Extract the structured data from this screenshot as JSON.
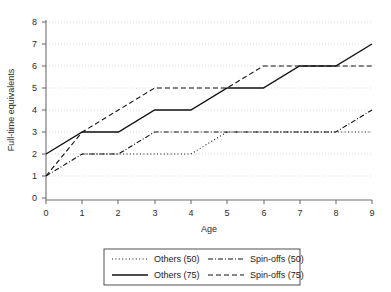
{
  "chart_data": {
    "type": "line",
    "title": "",
    "xlabel": "Age",
    "ylabel": "Full-time equivalents",
    "xlim": [
      0,
      9
    ],
    "ylim": [
      0,
      8
    ],
    "xticks": [
      0,
      1,
      2,
      3,
      4,
      5,
      6,
      7,
      8,
      9
    ],
    "yticks": [
      0,
      1,
      2,
      3,
      4,
      5,
      6,
      7,
      8
    ],
    "xtick_labels": [
      "0",
      "1",
      "2",
      "3",
      "4",
      "5",
      "6",
      "7",
      "8",
      "9"
    ],
    "ytick_labels": [
      "0",
      "1",
      "2",
      "3",
      "4",
      "5",
      "6",
      "7",
      "8"
    ],
    "grid": "horizontal-dotted",
    "legend_position": "below-axes",
    "x": [
      0,
      1,
      2,
      3,
      4,
      5,
      6,
      7,
      8,
      9
    ],
    "series": [
      {
        "name": "Others (50)",
        "style": "dotted",
        "color": "#111111",
        "x": [
          1,
          2,
          3,
          4,
          5,
          6,
          7,
          8,
          9
        ],
        "values": [
          2,
          2,
          2,
          2,
          3,
          3,
          3,
          3,
          3
        ]
      },
      {
        "name": "Others (75)",
        "style": "solid",
        "color": "#111111",
        "x": [
          0,
          1,
          2,
          3,
          4,
          5,
          6,
          7,
          8,
          9
        ],
        "values": [
          2,
          3,
          3,
          4,
          4,
          5,
          5,
          6,
          6,
          7
        ]
      },
      {
        "name": "Spin-offs (50)",
        "style": "dash-dot",
        "color": "#111111",
        "x": [
          0,
          1,
          2,
          3,
          4,
          5,
          6,
          7,
          8,
          9
        ],
        "values": [
          1,
          2,
          2,
          3,
          3,
          3,
          3,
          3,
          3,
          4
        ]
      },
      {
        "name": "Spin-offs (75)",
        "style": "dashed",
        "color": "#111111",
        "x": [
          0,
          1,
          2,
          3,
          4,
          5,
          6,
          7,
          8,
          9
        ],
        "values": [
          1,
          3,
          4,
          5,
          5,
          5,
          6,
          6,
          6,
          6
        ]
      }
    ]
  },
  "axes": {
    "xlabel": "Age",
    "ylabel": "Full-time equivalents",
    "ytick_labels": [
      "0",
      "1",
      "2",
      "3",
      "4",
      "5",
      "6",
      "7",
      "8"
    ],
    "xtick_labels": [
      "0",
      "1",
      "2",
      "3",
      "4",
      "5",
      "6",
      "7",
      "8",
      "9"
    ]
  },
  "legend": {
    "entries": [
      {
        "label": "Others (50)",
        "style": "dotted"
      },
      {
        "label": "Spin-offs (50)",
        "style": "dash-dot"
      },
      {
        "label": "Others (75)",
        "style": "solid"
      },
      {
        "label": "Spin-offs (75)",
        "style": "dashed"
      }
    ]
  }
}
